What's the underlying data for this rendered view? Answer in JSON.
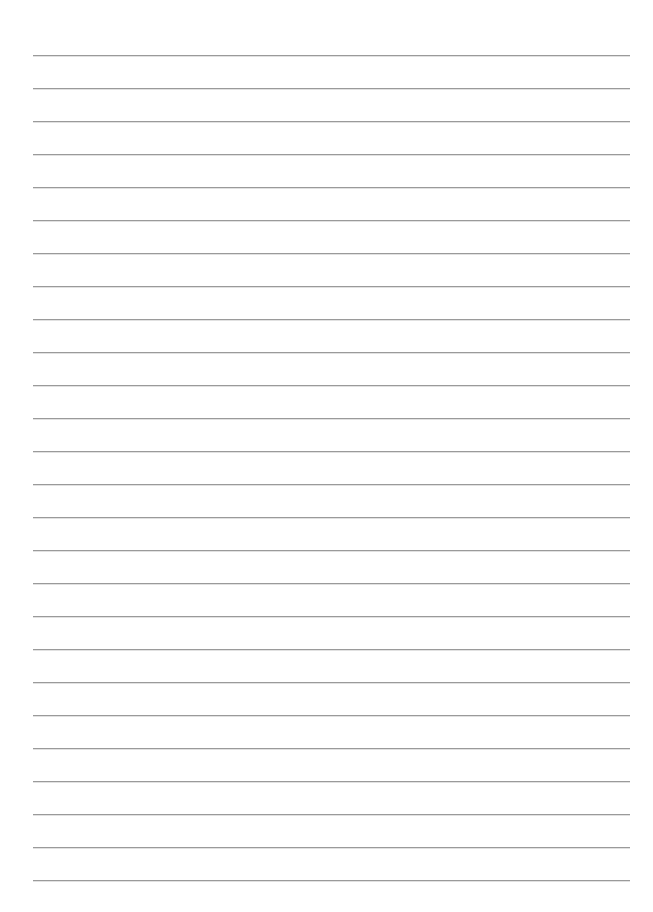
{
  "page": {
    "type": "lined-paper",
    "background_color": "#ffffff",
    "rule_color": "#9a9a9a",
    "rules": {
      "count": 26,
      "first_y": 55,
      "spacing": 33,
      "left_x": 33,
      "right_x": 630
    },
    "text_content": []
  }
}
